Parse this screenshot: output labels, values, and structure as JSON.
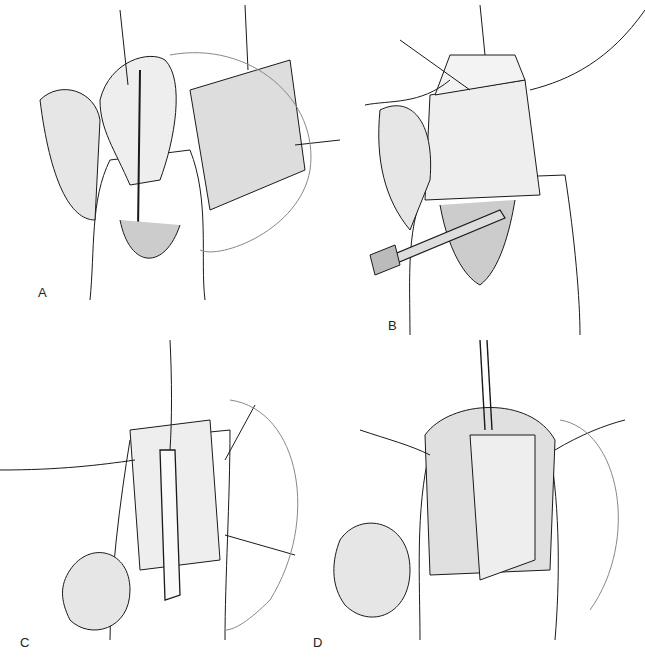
{
  "figure": {
    "panels": [
      {
        "id": "A",
        "label": "A",
        "description": "Urethral plate incised with lateral flaps; dorsal preputial flap with sutures"
      },
      {
        "id": "B",
        "label": "B",
        "description": "Preputial graft being positioned; forceps retracting tissue"
      },
      {
        "id": "C",
        "label": "C",
        "description": "Catheter placed in neourethra; graft sutured with lateral stay sutures"
      },
      {
        "id": "D",
        "label": "D",
        "description": "Completed repair with graft tubularized around catheter"
      }
    ],
    "caption": ""
  },
  "colors": {
    "ink": "#1a1a1a",
    "shade": "#555555",
    "background": "#ffffff"
  }
}
